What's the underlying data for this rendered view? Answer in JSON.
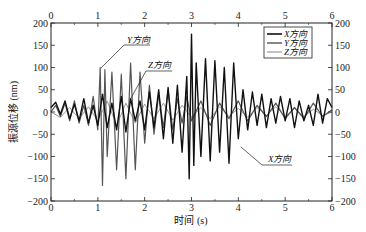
{
  "chart_data": {
    "type": "line",
    "title": "",
    "xlabel": "时间 (s)",
    "ylabel": "振源位移 (nm)",
    "xlim": [
      0,
      6
    ],
    "ylim": [
      -200,
      200
    ],
    "x_ticks": [
      0,
      1,
      2,
      3,
      4,
      5,
      6
    ],
    "y_ticks": [
      200,
      150,
      100,
      50,
      0,
      -50,
      -100,
      -150,
      -200
    ],
    "y_ticks_right": [
      200,
      150,
      100,
      50,
      0,
      -50,
      -100,
      -150,
      -200
    ],
    "x_ticks_top": [
      0,
      1,
      2,
      3,
      4,
      5,
      6
    ],
    "grid": false,
    "legend_position": "upper right",
    "legend": [
      "X方向",
      "Y方向",
      "Z方向"
    ],
    "annotations": [
      {
        "text": "Y方向",
        "x": 1.05,
        "y": 95
      },
      {
        "text": "Z方向",
        "x": 1.55,
        "y": 25
      },
      {
        "text": "X方向",
        "x": 3.85,
        "y": -75
      }
    ],
    "series": [
      {
        "name": "X方向",
        "color": "#111111",
        "width": 1.4,
        "x": [
          0,
          0.1,
          0.2,
          0.3,
          0.4,
          0.5,
          0.6,
          0.7,
          0.8,
          0.9,
          1.0,
          1.1,
          1.2,
          1.3,
          1.4,
          1.5,
          1.6,
          1.7,
          1.8,
          1.9,
          2.0,
          2.1,
          2.2,
          2.3,
          2.4,
          2.5,
          2.6,
          2.7,
          2.8,
          2.9,
          2.95,
          3.0,
          3.05,
          3.1,
          3.2,
          3.3,
          3.4,
          3.5,
          3.6,
          3.7,
          3.8,
          3.9,
          4.0,
          4.1,
          4.2,
          4.3,
          4.4,
          4.5,
          4.6,
          4.7,
          4.8,
          4.9,
          5.0,
          5.1,
          5.2,
          5.3,
          5.4,
          5.5,
          5.6,
          5.7,
          5.8,
          5.9,
          6.0
        ],
        "values": [
          10,
          22,
          -5,
          25,
          -15,
          18,
          -20,
          30,
          -25,
          15,
          -30,
          40,
          -35,
          20,
          -40,
          35,
          -45,
          30,
          -20,
          25,
          -40,
          45,
          -35,
          50,
          -60,
          55,
          -70,
          60,
          -90,
          80,
          -150,
          175,
          -120,
          110,
          -100,
          120,
          -110,
          115,
          -90,
          100,
          -115,
          110,
          -60,
          50,
          -40,
          45,
          -30,
          40,
          -35,
          30,
          -25,
          35,
          -20,
          30,
          -35,
          25,
          -20,
          15,
          -30,
          40,
          -25,
          30,
          10
        ]
      },
      {
        "name": "Y方向",
        "color": "#555555",
        "width": 1.2,
        "x": [
          0,
          0.1,
          0.2,
          0.3,
          0.4,
          0.5,
          0.6,
          0.7,
          0.8,
          0.9,
          1.0,
          1.05,
          1.1,
          1.15,
          1.2,
          1.3,
          1.4,
          1.5,
          1.6,
          1.7,
          1.8,
          1.9,
          2.0,
          2.1,
          2.2,
          2.3,
          2.4,
          2.5,
          2.6,
          2.7,
          2.8,
          2.9,
          3.0,
          3.2,
          3.4,
          3.6,
          3.8,
          4.0,
          4.2,
          4.4,
          4.6,
          4.8,
          5.0,
          5.2,
          5.4,
          5.6,
          5.8,
          6.0
        ],
        "values": [
          0,
          15,
          -10,
          20,
          -20,
          25,
          -25,
          15,
          -30,
          35,
          -40,
          100,
          -165,
          95,
          -100,
          90,
          -130,
          85,
          -150,
          110,
          -130,
          90,
          -70,
          60,
          -50,
          40,
          -35,
          50,
          -40,
          30,
          -25,
          35,
          -20,
          25,
          -30,
          20,
          -15,
          25,
          -20,
          15,
          -10,
          20,
          -15,
          10,
          -15,
          20,
          -10,
          5
        ]
      },
      {
        "name": "Z方向",
        "color": "#999999",
        "width": 1.0,
        "x": [
          0,
          0.2,
          0.4,
          0.6,
          0.8,
          1.0,
          1.2,
          1.4,
          1.6,
          1.8,
          2.0,
          2.2,
          2.4,
          2.6,
          2.8,
          3.0,
          3.2,
          3.4,
          3.6,
          3.8,
          4.0,
          4.2,
          4.4,
          4.6,
          4.8,
          5.0,
          5.2,
          5.4,
          5.6,
          5.8,
          6.0
        ],
        "values": [
          0,
          -12,
          10,
          -15,
          12,
          -20,
          25,
          -30,
          20,
          -25,
          18,
          -15,
          20,
          -18,
          15,
          -12,
          10,
          -15,
          12,
          -10,
          8,
          -12,
          10,
          -8,
          12,
          -10,
          8,
          -10,
          6,
          -8,
          0
        ]
      }
    ]
  }
}
